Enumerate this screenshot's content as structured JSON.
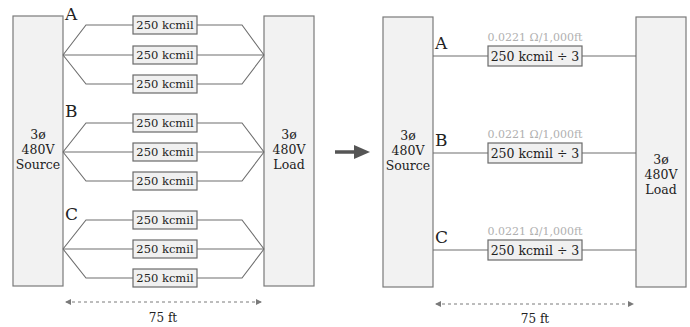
{
  "left_diagram": {
    "source_box": {
      "lines": [
        "3ø",
        "480V",
        "Source"
      ]
    },
    "load_box": {
      "lines": [
        "3ø",
        "480V",
        "Load"
      ]
    },
    "phases": [
      {
        "label": "A",
        "cables": [
          "250 kcmil",
          "250 kcmil",
          "250 kcmil"
        ]
      },
      {
        "label": "B",
        "cables": [
          "250 kcmil",
          "250 kcmil",
          "250 kcmil"
        ]
      },
      {
        "label": "C",
        "cables": [
          "250 kcmil",
          "250 kcmil",
          "250 kcmil"
        ]
      }
    ],
    "distance": "75 ft"
  },
  "arrow": {
    "icon": "right-arrow-icon",
    "color": "#555555"
  },
  "right_diagram": {
    "source_box": {
      "lines": [
        "3ø",
        "480V",
        "Source"
      ]
    },
    "load_box": {
      "lines": [
        "3ø",
        "480V",
        "Load"
      ]
    },
    "phases": [
      {
        "label": "A",
        "cable": "250 kcmil ÷ 3",
        "resistance": "0.0221 Ω/1,000ft"
      },
      {
        "label": "B",
        "cable": "250 kcmil ÷ 3",
        "resistance": "0.0221 Ω/1,000ft"
      },
      {
        "label": "C",
        "cable": "250 kcmil ÷ 3",
        "resistance": "0.0221 Ω/1,000ft"
      }
    ],
    "distance": "75 ft"
  },
  "colors": {
    "box_fill": "#f2f2f2",
    "box_stroke": "#7a7a7a",
    "resistance_text": "#b0b0b0",
    "text": "#222222"
  }
}
